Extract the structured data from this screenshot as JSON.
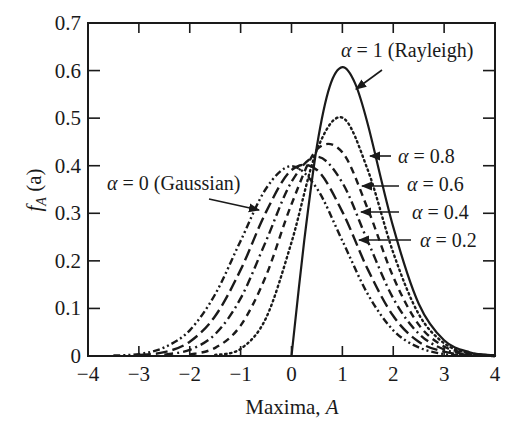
{
  "chart_data": {
    "type": "line",
    "title": "",
    "xlabel": "Maxima, A",
    "xlabel_text": "Maxima, ",
    "xlabel_var": "A",
    "ylabel": "f_A (a)",
    "ylabel_f": "f",
    "ylabel_sub": "A",
    "ylabel_arg": " (a)",
    "xlim": [
      -4,
      4
    ],
    "ylim": [
      0,
      0.7
    ],
    "xticks": [
      -4,
      -3,
      -2,
      -1,
      0,
      1,
      2,
      3,
      4
    ],
    "xtick_labels": [
      "−4",
      "−3",
      "−2",
      "−1",
      "0",
      "1",
      "2",
      "3",
      "4"
    ],
    "yticks": [
      0,
      0.1,
      0.2,
      0.3,
      0.4,
      0.5,
      0.6,
      0.7
    ],
    "ytick_labels": [
      "0",
      "0.1",
      "0.2",
      "0.3",
      "0.4",
      "0.5",
      "0.6",
      "0.7"
    ],
    "grid": false,
    "legend": "inline annotations with arrows",
    "series": [
      {
        "name": "α = 1 (Rayleigh)",
        "alpha": 1,
        "style": "solid",
        "x": [
          0,
          0.25,
          0.5,
          0.75,
          1,
          1.25,
          1.5,
          2,
          2.5,
          3,
          3.5,
          4
        ],
        "values": [
          0,
          0.242,
          0.441,
          0.566,
          0.607,
          0.573,
          0.487,
          0.271,
          0.11,
          0.033,
          0.008,
          0.001
        ]
      },
      {
        "name": "α = 0.8",
        "alpha": 0.8,
        "style": "dotted",
        "x": [
          -1.5,
          -1,
          -0.5,
          0,
          0.5,
          1,
          1.5,
          2,
          2.5,
          3,
          3.5,
          4
        ],
        "values": [
          0.002,
          0.015,
          0.08,
          0.239,
          0.433,
          0.501,
          0.391,
          0.217,
          0.088,
          0.027,
          0.006,
          0.001
        ]
      },
      {
        "name": "α = 0.6",
        "alpha": 0.6,
        "style": "dashed",
        "x": [
          -2,
          -1.5,
          -1,
          -0.5,
          0,
          0.5,
          1,
          1.5,
          2,
          2.5,
          3,
          3.5,
          4
        ],
        "values": [
          0.003,
          0.017,
          0.064,
          0.169,
          0.319,
          0.434,
          0.428,
          0.309,
          0.166,
          0.066,
          0.02,
          0.005,
          0.001
        ]
      },
      {
        "name": "α = 0.4",
        "alpha": 0.4,
        "style": "dash-dot",
        "x": [
          -2.5,
          -2,
          -1.5,
          -1,
          -0.5,
          0,
          0.5,
          1,
          1.5,
          2,
          2.5,
          3,
          3.5,
          4
        ],
        "values": [
          0.003,
          0.013,
          0.046,
          0.121,
          0.242,
          0.366,
          0.419,
          0.364,
          0.241,
          0.121,
          0.047,
          0.014,
          0.003,
          0.001
        ]
      },
      {
        "name": "α = 0.2",
        "alpha": 0.2,
        "style": "long-dash",
        "x": [
          -3,
          -2.5,
          -2,
          -1.5,
          -1,
          -0.5,
          0,
          0.5,
          1,
          1.5,
          2,
          2.5,
          3,
          3.5,
          4
        ],
        "values": [
          0.002,
          0.008,
          0.03,
          0.084,
          0.181,
          0.303,
          0.391,
          0.391,
          0.303,
          0.182,
          0.084,
          0.03,
          0.009,
          0.002,
          0.0
        ]
      },
      {
        "name": "α = 0 (Gaussian)",
        "alpha": 0,
        "style": "dash-dot-dot",
        "x": [
          -3.5,
          -3,
          -2.5,
          -2,
          -1.5,
          -1,
          -0.5,
          0,
          0.5,
          1,
          1.5,
          2,
          2.5,
          3,
          3.5,
          4
        ],
        "values": [
          0.001,
          0.004,
          0.018,
          0.054,
          0.13,
          0.242,
          0.352,
          0.399,
          0.352,
          0.242,
          0.13,
          0.054,
          0.018,
          0.004,
          0.001,
          0.0
        ]
      }
    ],
    "annotations": [
      {
        "id": "rayleigh",
        "text_prefix": "α",
        "text": " = 1 (Rayleigh)",
        "text_x": 341,
        "text_y": 57,
        "arrow_from": [
          382,
          70
        ],
        "arrow_to": [
          356,
          89
        ]
      },
      {
        "id": "a08",
        "text_prefix": "α",
        "text": " = 0.8",
        "text_x": 398,
        "text_y": 163,
        "arrow_from": [
          391,
          156
        ],
        "arrow_to": [
          370,
          156
        ]
      },
      {
        "id": "a06",
        "text_prefix": "α",
        "text": " = 0.6",
        "text_x": 407,
        "text_y": 191,
        "arrow_from": [
          399,
          186
        ],
        "arrow_to": [
          362,
          186
        ]
      },
      {
        "id": "a04",
        "text_prefix": "α",
        "text": " = 0.4",
        "text_x": 412,
        "text_y": 219,
        "arrow_from": [
          399,
          212
        ],
        "arrow_to": [
          361,
          212
        ]
      },
      {
        "id": "a02",
        "text_prefix": "α",
        "text": " = 0.2",
        "text_x": 420,
        "text_y": 247,
        "arrow_from": [
          411,
          240
        ],
        "arrow_to": [
          359,
          240
        ]
      },
      {
        "id": "gaussian",
        "text_prefix": "α",
        "text": " = 0 (Gaussian)",
        "text_x": 107,
        "text_y": 190,
        "arrow_from": [
          209,
          199
        ],
        "arrow_to": [
          259,
          210
        ]
      }
    ]
  }
}
